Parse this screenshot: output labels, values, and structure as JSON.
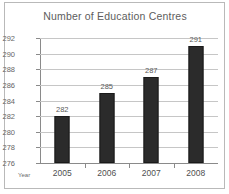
{
  "figure": {
    "title": "Number of Education Centres",
    "axis_name": "Year",
    "frame_color": "#b9b9b9",
    "bar_color": "#2b2b2b",
    "grid_color": "#c6c6c6",
    "axis_color": "#8a8a8a",
    "text_color": "#5d5d5d"
  },
  "chart_data": {
    "type": "bar",
    "title": "Number of Education Centres",
    "xlabel": "Year",
    "ylabel": "",
    "categories": [
      "2005",
      "2006",
      "2007",
      "2008"
    ],
    "values": [
      282,
      285,
      287,
      291
    ],
    "value_labels": [
      "282",
      "285",
      "287",
      "291"
    ],
    "ylim": [
      276,
      292
    ],
    "yticks": [
      276,
      278,
      280,
      282,
      284,
      286,
      288,
      290,
      292
    ],
    "ytick_labels": [
      "276",
      "278",
      "280",
      "282",
      "284",
      "286",
      "288",
      "290",
      "292"
    ],
    "grid": true,
    "grid_axis": "y",
    "legend": false,
    "series": [
      {
        "name": "Number of Education Centres",
        "values": [
          282,
          285,
          287,
          291
        ]
      }
    ]
  }
}
